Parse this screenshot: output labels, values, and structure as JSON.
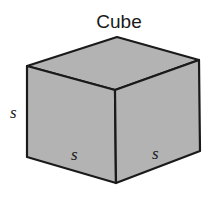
{
  "title": "Cube",
  "labels": {
    "left_edge": "s",
    "front_bottom_edge": "s",
    "right_bottom_edge": "s"
  },
  "colors": {
    "face_fill": "#b3b3b3",
    "edge_stroke": "#1a1a1a",
    "background": "#ffffff"
  }
}
